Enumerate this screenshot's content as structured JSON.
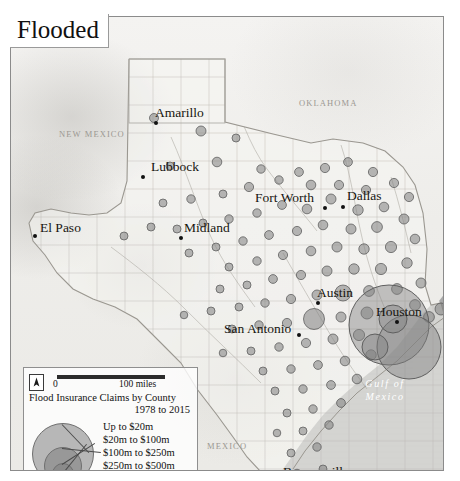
{
  "title": "Flooded",
  "map": {
    "cities": [
      {
        "name": "Amarillo",
        "x": 145,
        "y": 106,
        "dx": -1,
        "dy": -12,
        "dot": true
      },
      {
        "name": "Lubbock",
        "x": 132,
        "y": 160,
        "dx": 8,
        "dy": -12,
        "dot": true
      },
      {
        "name": "Midland",
        "x": 170,
        "y": 221,
        "dx": 3,
        "dy": -12,
        "dot": true
      },
      {
        "name": "El Paso",
        "x": 24,
        "y": 219,
        "dx": 5,
        "dy": -10,
        "dot": true
      },
      {
        "name": "Fort Worth",
        "x": 314,
        "y": 191,
        "dx": -70,
        "dy": -12,
        "dot": true
      },
      {
        "name": "Dallas",
        "x": 332,
        "y": 190,
        "dx": 4,
        "dy": -13,
        "dot": true
      },
      {
        "name": "Austin",
        "x": 307,
        "y": 286,
        "dx": -1,
        "dy": -12,
        "dot": true
      },
      {
        "name": "San Antonio",
        "x": 288,
        "y": 318,
        "dx": -75,
        "dy": -8,
        "dot": true
      },
      {
        "name": "Houston",
        "x": 386,
        "y": 305,
        "dx": -21,
        "dy": -12,
        "dot": true
      },
      {
        "name": "Brownsville",
        "x": 312,
        "y": 465,
        "dx": -40,
        "dy": -12,
        "dot": true
      }
    ],
    "regions": [
      {
        "name": "NEW MEXICO",
        "x": 48,
        "y": 112
      },
      {
        "name": "OKLAHOMA",
        "x": 288,
        "y": 81
      },
      {
        "name": "MEXICO",
        "x": 196,
        "y": 424
      }
    ],
    "water_label": {
      "line1": "Gulf of",
      "line2": "Mexico",
      "x": 366,
      "y": 378
    },
    "claim_circles": [
      {
        "x": 143,
        "y": 101,
        "r": 4.5
      },
      {
        "x": 190,
        "y": 114,
        "r": 5.0
      },
      {
        "x": 225,
        "y": 121,
        "r": 4.0
      },
      {
        "x": 206,
        "y": 145,
        "r": 4.8
      },
      {
        "x": 159,
        "y": 149,
        "r": 4.0
      },
      {
        "x": 250,
        "y": 152,
        "r": 4.2
      },
      {
        "x": 288,
        "y": 155,
        "r": 4.4
      },
      {
        "x": 314,
        "y": 151,
        "r": 4.6
      },
      {
        "x": 337,
        "y": 145,
        "r": 4.4
      },
      {
        "x": 362,
        "y": 155,
        "r": 4.6
      },
      {
        "x": 268,
        "y": 163,
        "r": 4.2
      },
      {
        "x": 238,
        "y": 170,
        "r": 4.6
      },
      {
        "x": 212,
        "y": 177,
        "r": 4.0
      },
      {
        "x": 180,
        "y": 182,
        "r": 4.2
      },
      {
        "x": 152,
        "y": 186,
        "r": 4.0
      },
      {
        "x": 300,
        "y": 168,
        "r": 4.8
      },
      {
        "x": 328,
        "y": 168,
        "r": 4.6
      },
      {
        "x": 355,
        "y": 173,
        "r": 4.6
      },
      {
        "x": 383,
        "y": 166,
        "r": 4.6
      },
      {
        "x": 398,
        "y": 180,
        "r": 4.6
      },
      {
        "x": 373,
        "y": 190,
        "r": 4.8
      },
      {
        "x": 347,
        "y": 193,
        "r": 5.2
      },
      {
        "x": 320,
        "y": 182,
        "r": 5.0
      },
      {
        "x": 296,
        "y": 192,
        "r": 4.8
      },
      {
        "x": 271,
        "y": 188,
        "r": 4.4
      },
      {
        "x": 246,
        "y": 196,
        "r": 4.2
      },
      {
        "x": 218,
        "y": 202,
        "r": 4.2
      },
      {
        "x": 192,
        "y": 206,
        "r": 4.0
      },
      {
        "x": 166,
        "y": 212,
        "r": 4.0
      },
      {
        "x": 140,
        "y": 210,
        "r": 4.0
      },
      {
        "x": 113,
        "y": 219,
        "r": 4.0
      },
      {
        "x": 393,
        "y": 202,
        "r": 5.0
      },
      {
        "x": 366,
        "y": 210,
        "r": 5.4
      },
      {
        "x": 340,
        "y": 212,
        "r": 5.0
      },
      {
        "x": 312,
        "y": 208,
        "r": 4.8
      },
      {
        "x": 286,
        "y": 214,
        "r": 4.6
      },
      {
        "x": 258,
        "y": 218,
        "r": 4.4
      },
      {
        "x": 232,
        "y": 224,
        "r": 4.2
      },
      {
        "x": 205,
        "y": 230,
        "r": 4.0
      },
      {
        "x": 178,
        "y": 236,
        "r": 4.0
      },
      {
        "x": 404,
        "y": 222,
        "r": 4.8
      },
      {
        "x": 380,
        "y": 230,
        "r": 5.6
      },
      {
        "x": 353,
        "y": 232,
        "r": 5.2
      },
      {
        "x": 326,
        "y": 230,
        "r": 5.0
      },
      {
        "x": 300,
        "y": 234,
        "r": 4.8
      },
      {
        "x": 272,
        "y": 238,
        "r": 4.6
      },
      {
        "x": 246,
        "y": 244,
        "r": 4.2
      },
      {
        "x": 218,
        "y": 250,
        "r": 4.0
      },
      {
        "x": 396,
        "y": 246,
        "r": 5.2
      },
      {
        "x": 370,
        "y": 252,
        "r": 5.6
      },
      {
        "x": 343,
        "y": 252,
        "r": 5.2
      },
      {
        "x": 316,
        "y": 254,
        "r": 5.0
      },
      {
        "x": 290,
        "y": 258,
        "r": 4.6
      },
      {
        "x": 262,
        "y": 262,
        "r": 4.4
      },
      {
        "x": 236,
        "y": 268,
        "r": 4.0
      },
      {
        "x": 209,
        "y": 272,
        "r": 4.0
      },
      {
        "x": 410,
        "y": 266,
        "r": 5.0
      },
      {
        "x": 386,
        "y": 272,
        "r": 5.4
      },
      {
        "x": 358,
        "y": 274,
        "r": 5.4
      },
      {
        "x": 332,
        "y": 276,
        "r": 8.0
      },
      {
        "x": 306,
        "y": 278,
        "r": 5.0
      },
      {
        "x": 280,
        "y": 282,
        "r": 4.6
      },
      {
        "x": 254,
        "y": 286,
        "r": 4.2
      },
      {
        "x": 228,
        "y": 290,
        "r": 4.0
      },
      {
        "x": 200,
        "y": 294,
        "r": 4.0
      },
      {
        "x": 173,
        "y": 298,
        "r": 3.8
      },
      {
        "x": 404,
        "y": 288,
        "r": 5.4
      },
      {
        "x": 356,
        "y": 296,
        "r": 6.0
      },
      {
        "x": 330,
        "y": 300,
        "r": 5.0
      },
      {
        "x": 303,
        "y": 302,
        "r": 10.5
      },
      {
        "x": 276,
        "y": 306,
        "r": 4.6
      },
      {
        "x": 248,
        "y": 308,
        "r": 4.2
      },
      {
        "x": 221,
        "y": 312,
        "r": 4.0
      },
      {
        "x": 418,
        "y": 300,
        "r": 5.4
      },
      {
        "x": 430,
        "y": 292,
        "r": 6.0
      },
      {
        "x": 348,
        "y": 318,
        "r": 5.6
      },
      {
        "x": 322,
        "y": 322,
        "r": 5.0
      },
      {
        "x": 295,
        "y": 326,
        "r": 4.6
      },
      {
        "x": 268,
        "y": 330,
        "r": 4.2
      },
      {
        "x": 240,
        "y": 334,
        "r": 4.0
      },
      {
        "x": 212,
        "y": 336,
        "r": 3.8
      },
      {
        "x": 360,
        "y": 338,
        "r": 5.2
      },
      {
        "x": 334,
        "y": 344,
        "r": 4.8
      },
      {
        "x": 307,
        "y": 348,
        "r": 4.4
      },
      {
        "x": 280,
        "y": 352,
        "r": 4.2
      },
      {
        "x": 252,
        "y": 354,
        "r": 4.0
      },
      {
        "x": 346,
        "y": 362,
        "r": 4.8
      },
      {
        "x": 320,
        "y": 368,
        "r": 4.4
      },
      {
        "x": 292,
        "y": 372,
        "r": 4.2
      },
      {
        "x": 264,
        "y": 374,
        "r": 4.0
      },
      {
        "x": 330,
        "y": 386,
        "r": 4.4
      },
      {
        "x": 302,
        "y": 392,
        "r": 4.2
      },
      {
        "x": 276,
        "y": 396,
        "r": 4.0
      },
      {
        "x": 318,
        "y": 408,
        "r": 4.2
      },
      {
        "x": 292,
        "y": 414,
        "r": 4.0
      },
      {
        "x": 266,
        "y": 416,
        "r": 3.8
      },
      {
        "x": 306,
        "y": 430,
        "r": 4.2
      },
      {
        "x": 280,
        "y": 436,
        "r": 4.0
      },
      {
        "x": 312,
        "y": 452,
        "r": 4.0
      },
      {
        "x": 286,
        "y": 456,
        "r": 3.8
      }
    ],
    "major_circles": [
      {
        "name": "harris-county",
        "x": 378,
        "y": 308,
        "r": 40
      },
      {
        "name": "galveston-area",
        "x": 398,
        "y": 330,
        "r": 32
      },
      {
        "name": "brazoria-area",
        "x": 364,
        "y": 330,
        "r": 13
      },
      {
        "name": "houston-inner",
        "x": 382,
        "y": 302,
        "r": 14
      }
    ]
  },
  "legend": {
    "scale_start": "0",
    "scale_end": "100 miles",
    "north_glyph": "⬆",
    "title_line1": "Flood Insurance Claims by County",
    "title_line2": "1978 to 2015",
    "classes": [
      {
        "label": "Up to $20m",
        "r": 5
      },
      {
        "label": "$20m to $100m",
        "r": 10
      },
      {
        "label": "$100m to $250m",
        "r": 18
      },
      {
        "label": "$250m to $500m",
        "r": 30
      }
    ]
  },
  "colors": {
    "circle_fill": "#808080",
    "circle_stroke": "#5f5f5f",
    "water": "#a9a9a9",
    "land": "#efeeea"
  }
}
